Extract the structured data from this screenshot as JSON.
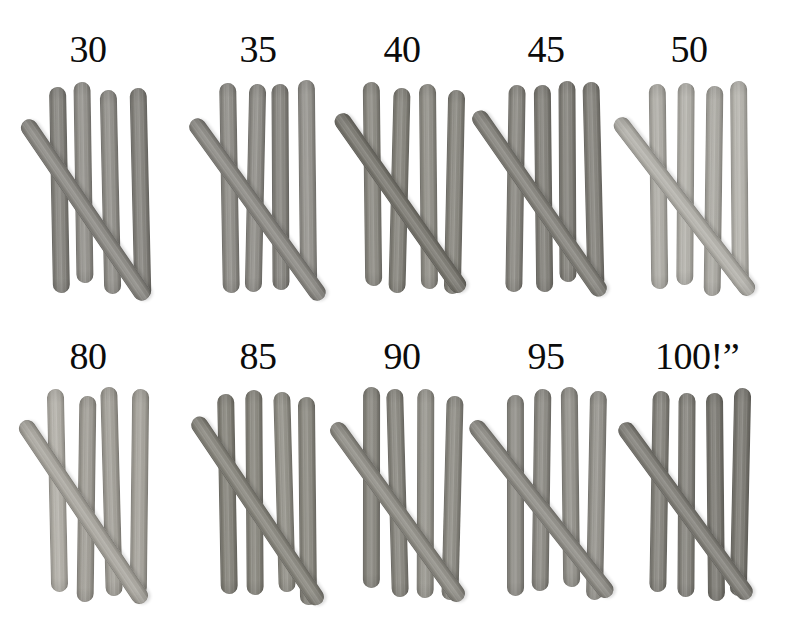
{
  "page": {
    "background_color": "#ffffff",
    "width": 795,
    "height": 624,
    "label_color": "#0b0b0b"
  },
  "chart_data": {
    "type": "table",
    "xlabel": "",
    "ylabel": "",
    "categories": [
      "30",
      "35",
      "40",
      "45",
      "50",
      "80",
      "85",
      "90",
      "95",
      "100!”"
    ],
    "values": [
      5,
      5,
      5,
      5,
      5,
      5,
      5,
      5,
      5,
      5
    ],
    "legend_position": "none",
    "grid": false
  },
  "groups": [
    {
      "label": "30",
      "label_x": 88,
      "label_y": 30,
      "sticks_per_group": 5,
      "vertical_count": 4,
      "diagonal_count": 1,
      "tone": "#87857f",
      "row": 1,
      "column": 1
    },
    {
      "label": "35",
      "label_x": 258,
      "label_y": 30,
      "sticks_per_group": 5,
      "vertical_count": 4,
      "diagonal_count": 1,
      "tone": "#8d8b85",
      "row": 1,
      "column": 2
    },
    {
      "label": "40",
      "label_x": 402,
      "label_y": 30,
      "sticks_per_group": 5,
      "vertical_count": 4,
      "diagonal_count": 1,
      "tone": "#838179",
      "row": 1,
      "column": 3
    },
    {
      "label": "45",
      "label_x": 546,
      "label_y": 30,
      "sticks_per_group": 5,
      "vertical_count": 4,
      "diagonal_count": 1,
      "tone": "#86847d",
      "row": 1,
      "column": 4
    },
    {
      "label": "50",
      "label_x": 689,
      "label_y": 30,
      "sticks_per_group": 5,
      "vertical_count": 4,
      "diagonal_count": 1,
      "tone": "#b0aea7",
      "row": 1,
      "column": 5
    },
    {
      "label": "80",
      "label_x": 88,
      "label_y": 337,
      "sticks_per_group": 5,
      "vertical_count": 4,
      "diagonal_count": 1,
      "tone": "#a7a49c",
      "row": 2,
      "column": 1
    },
    {
      "label": "85",
      "label_x": 258,
      "label_y": 337,
      "sticks_per_group": 5,
      "vertical_count": 4,
      "diagonal_count": 1,
      "tone": "#848279",
      "row": 2,
      "column": 2
    },
    {
      "label": "90",
      "label_x": 402,
      "label_y": 337,
      "sticks_per_group": 5,
      "vertical_count": 4,
      "diagonal_count": 1,
      "tone": "#8b8981",
      "row": 2,
      "column": 3
    },
    {
      "label": "95",
      "label_x": 546,
      "label_y": 337,
      "sticks_per_group": 5,
      "vertical_count": 4,
      "diagonal_count": 1,
      "tone": "#93918a",
      "row": 2,
      "column": 4
    },
    {
      "label": "100!”",
      "label_x": 697,
      "label_y": 337,
      "sticks_per_group": 5,
      "vertical_count": 4,
      "diagonal_count": 1,
      "tone": "#807e77",
      "row": 2,
      "column": 5
    }
  ],
  "layout": {
    "row1_stick_top": 85,
    "row1_stick_height": 206,
    "row2_stick_top": 392,
    "row2_stick_height": 204,
    "stick_width": 17,
    "diagonal_length": 218,
    "diagonal_angle_deg": 36,
    "group_origins_x": [
      35,
      206,
      350,
      492,
      637,
      35,
      206,
      350,
      492,
      637
    ],
    "vertical_offsets_x": [
      0,
      27,
      54,
      81
    ]
  }
}
